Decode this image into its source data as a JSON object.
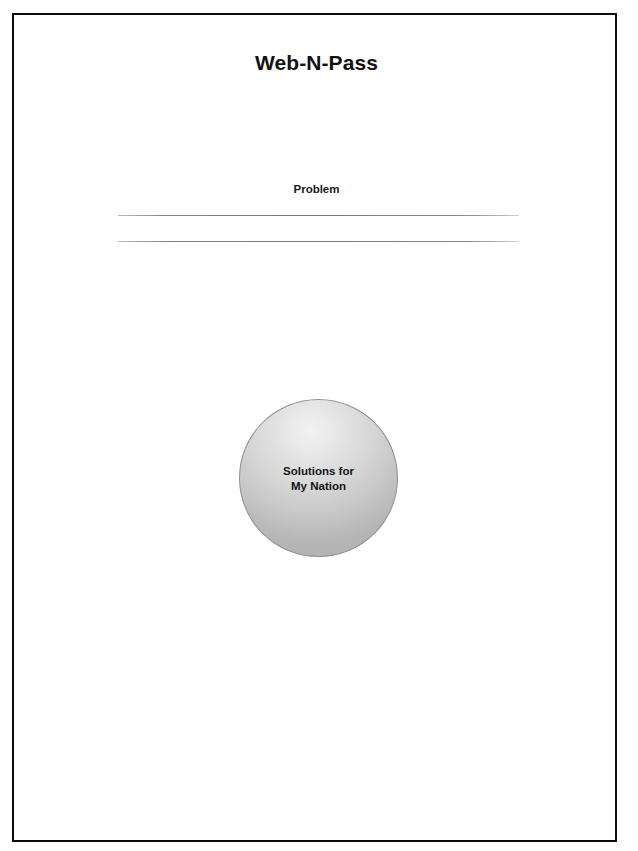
{
  "document": {
    "title": "Web-N-Pass",
    "sections": {
      "problem": {
        "heading": "Problem",
        "answer_lines": [
          "",
          ""
        ]
      },
      "solution": {
        "bubble_label": "Solutions for\nMy Nation"
      }
    }
  },
  "colors": {
    "page_background": "#ffffff",
    "frame_border": "#0b0b0b",
    "text": "#121212",
    "rule_line": "#76787c",
    "bubble_highlight": "#f2f2f2",
    "bubble_edge": "#b4b4b4",
    "bubble_outline": "#8f9092"
  }
}
